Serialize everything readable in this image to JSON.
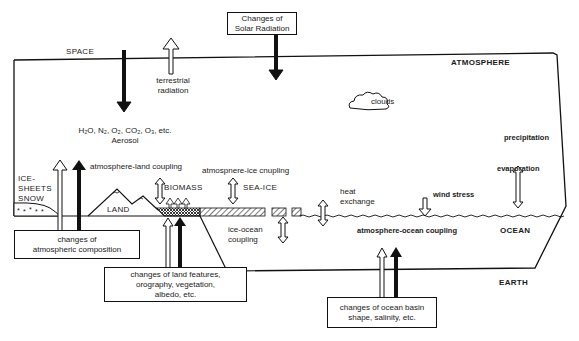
{
  "diagram": {
    "regions": {
      "space": "SPACE",
      "atmosphere": "ATMOSPHERE",
      "ocean": "OCEAN",
      "earth": "EARTH",
      "land": "LAND",
      "biomass": "BIOMASS",
      "sea_ice": "SEA-ICE",
      "ice_sheets": [
        "ICE-",
        "SHEETS",
        "SNOW"
      ],
      "clouds": "clouds"
    },
    "atmospheric_constituents": {
      "line1": "H₂O, N₂, O₂, CO₂, O₃, etc.",
      "line2": "Aerosol"
    },
    "processes": {
      "terrestrial_radiation": [
        "terrestrial",
        "radiation"
      ],
      "atmosphere_land_coupling": "atmosphere-land coupling",
      "atmosphere_ice_coupling": "atmospnere-ice cnupling",
      "heat_exchange": [
        "heat",
        "exchange"
      ],
      "wind_stress": "wind stress",
      "precipitation": "precipitation",
      "evaporation": "evaporation",
      "ice_ocean_coupling": [
        "ice-ocean",
        "coupling"
      ],
      "atmosphere_ocean_coupling": "atmosphere-ocean coupling"
    },
    "external_forcings": {
      "solar": [
        "Changes of",
        "Solar Radiation"
      ],
      "atmospheric_composition": [
        "changes of",
        "atmospheric composition"
      ],
      "land_features": [
        "changes of land features,",
        "orography, vegetation,",
        "albedo, etc."
      ],
      "ocean_basin": [
        "changes of ocean basin",
        "shape, salinity, etc."
      ]
    }
  }
}
